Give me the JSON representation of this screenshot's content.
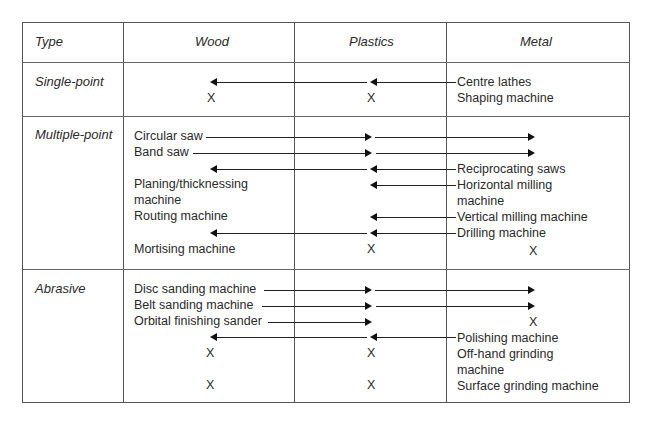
{
  "table": {
    "headers": [
      "Type",
      "Wood",
      "Plastics",
      "Metal"
    ],
    "rows": [
      {
        "type": "Single-point",
        "wood": [
          "X"
        ],
        "plastics": [
          "X"
        ],
        "metal": [
          "Centre lathes",
          "Shaping machine"
        ]
      },
      {
        "type": "Multiple-point",
        "wood": [
          "Circular saw",
          "Band saw",
          "Planing/thicknessing",
          "machine",
          "Routing machine",
          "Mortising machine"
        ],
        "plastics": [
          "X"
        ],
        "metal": [
          "Reciprocating saws",
          "Horizontal milling",
          "machine",
          "Vertical milling machine",
          "Drilling machine",
          "X"
        ]
      },
      {
        "type": "Abrasive",
        "wood": [
          "Disc sanding machine",
          "Belt sanding machine",
          "Orbital finishing sander",
          "X",
          "X"
        ],
        "plastics": [
          "X",
          "X"
        ],
        "metal": [
          "X",
          "Polishing machine",
          "Off-hand grinding",
          "machine",
          "Surface grinding machine"
        ]
      }
    ]
  },
  "legend": {
    "x_mark": "X"
  }
}
